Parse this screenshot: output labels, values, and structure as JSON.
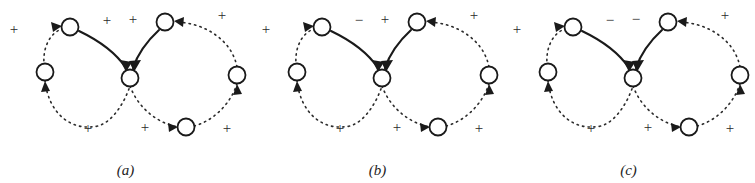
{
  "figure": {
    "background_color": "#ffffff",
    "ink_color": "#1d1d1d",
    "panel_count": 3
  },
  "panels": [
    {
      "id": "a",
      "caption": "(a)",
      "nodes": [
        {
          "name": "center-node",
          "cx": 130,
          "cy": 78
        },
        {
          "name": "top-left-node",
          "cx": 70,
          "cy": 27
        },
        {
          "name": "top-right-node",
          "cx": 165,
          "cy": 22
        },
        {
          "name": "far-left-node",
          "cx": 45,
          "cy": 72
        },
        {
          "name": "far-right-node",
          "cx": 237,
          "cy": 75
        },
        {
          "name": "bottom-node",
          "cx": 186,
          "cy": 127
        }
      ],
      "edge_labels": [
        {
          "name": "sign-left-outer",
          "text": "+",
          "x": 14,
          "y": 31
        },
        {
          "name": "sign-left-solid",
          "text": "+",
          "x": 107,
          "y": 22
        },
        {
          "name": "sign-right-solid",
          "text": "+",
          "x": 133,
          "y": 21
        },
        {
          "name": "sign-right-outer",
          "text": "+",
          "x": 222,
          "y": 17
        },
        {
          "name": "sign-bottom-left",
          "text": "+",
          "x": 88,
          "y": 130
        },
        {
          "name": "sign-bottom-mid",
          "text": "+",
          "x": 145,
          "y": 129
        },
        {
          "name": "sign-bottom-right",
          "text": "+",
          "x": 227,
          "y": 130
        }
      ]
    },
    {
      "id": "b",
      "caption": "(b)",
      "nodes": [
        {
          "name": "center-node",
          "cx": 130,
          "cy": 78
        },
        {
          "name": "top-left-node",
          "cx": 70,
          "cy": 27
        },
        {
          "name": "top-right-node",
          "cx": 165,
          "cy": 22
        },
        {
          "name": "far-left-node",
          "cx": 45,
          "cy": 72
        },
        {
          "name": "far-right-node",
          "cx": 237,
          "cy": 75
        },
        {
          "name": "bottom-node",
          "cx": 186,
          "cy": 127
        }
      ],
      "edge_labels": [
        {
          "name": "sign-left-outer",
          "text": "+",
          "x": 14,
          "y": 31
        },
        {
          "name": "sign-left-solid",
          "text": "−",
          "x": 107,
          "y": 22
        },
        {
          "name": "sign-right-solid",
          "text": "+",
          "x": 133,
          "y": 21
        },
        {
          "name": "sign-right-outer",
          "text": "+",
          "x": 222,
          "y": 17
        },
        {
          "name": "sign-bottom-left",
          "text": "+",
          "x": 88,
          "y": 130
        },
        {
          "name": "sign-bottom-mid",
          "text": "+",
          "x": 145,
          "y": 129
        },
        {
          "name": "sign-bottom-right",
          "text": "+",
          "x": 227,
          "y": 130
        }
      ]
    },
    {
      "id": "c",
      "caption": "(c)",
      "nodes": [
        {
          "name": "center-node",
          "cx": 130,
          "cy": 78
        },
        {
          "name": "top-left-node",
          "cx": 70,
          "cy": 27
        },
        {
          "name": "top-right-node",
          "cx": 165,
          "cy": 22
        },
        {
          "name": "far-left-node",
          "cx": 45,
          "cy": 72
        },
        {
          "name": "far-right-node",
          "cx": 237,
          "cy": 75
        },
        {
          "name": "bottom-node",
          "cx": 186,
          "cy": 127
        }
      ],
      "edge_labels": [
        {
          "name": "sign-left-outer",
          "text": "+",
          "x": 14,
          "y": 31
        },
        {
          "name": "sign-left-solid",
          "text": "−",
          "x": 107,
          "y": 22
        },
        {
          "name": "sign-right-solid",
          "text": "−",
          "x": 133,
          "y": 21
        },
        {
          "name": "sign-right-outer",
          "text": "+",
          "x": 222,
          "y": 17
        },
        {
          "name": "sign-bottom-left",
          "text": "+",
          "x": 88,
          "y": 130
        },
        {
          "name": "sign-bottom-mid",
          "text": "+",
          "x": 145,
          "y": 129
        },
        {
          "name": "sign-bottom-right",
          "text": "+",
          "x": 227,
          "y": 130
        }
      ]
    }
  ]
}
